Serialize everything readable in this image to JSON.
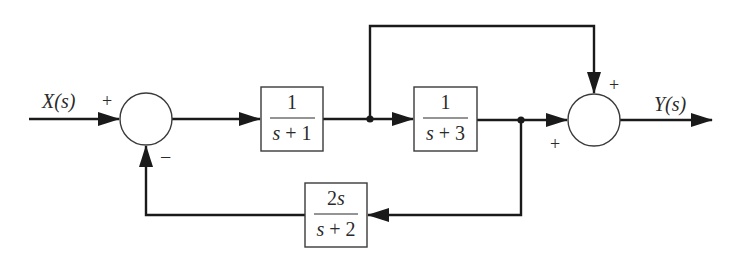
{
  "diagram": {
    "type": "block-diagram",
    "input": {
      "label": "X(s)",
      "sign_at_sum1": "+"
    },
    "output": {
      "label": "Y(s)"
    },
    "summing_junctions": [
      {
        "id": "sum1",
        "inputs": [
          {
            "from": "X(s)",
            "sign": "+"
          },
          {
            "from": "feedback",
            "sign": "−"
          }
        ]
      },
      {
        "id": "sum2",
        "inputs": [
          {
            "from": "feedforward",
            "sign": "+"
          },
          {
            "from": "block2",
            "sign": "+"
          }
        ]
      }
    ],
    "blocks": [
      {
        "id": "block1",
        "numerator": "1",
        "denominator": "s + 1"
      },
      {
        "id": "block2",
        "numerator": "1",
        "denominator": "s + 3"
      },
      {
        "id": "feedback",
        "numerator": "2s",
        "denominator": "s + 2"
      }
    ],
    "signs": {
      "sum1_top": "+",
      "sum1_bottom": "−",
      "sum2_top": "+",
      "sum2_left": "+"
    }
  }
}
